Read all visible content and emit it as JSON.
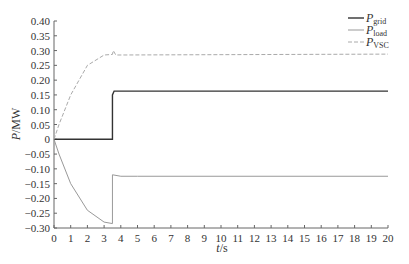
{
  "chart_data": {
    "type": "line",
    "title": "",
    "xlabel": "t/s",
    "ylabel": "P/MW",
    "xlim": [
      0,
      20
    ],
    "ylim": [
      -0.3,
      0.4
    ],
    "x_ticks": [
      "0",
      "1",
      "2",
      "3",
      "4",
      "5",
      "6",
      "7",
      "8",
      "9",
      "10",
      "11",
      "12",
      "13",
      "14",
      "15",
      "16",
      "17",
      "18",
      "19",
      "20"
    ],
    "y_ticks": [
      "0.40",
      "0.35",
      "0.30",
      "0.25",
      "0.20",
      "0.15",
      "0.10",
      "0.05",
      "0",
      "-0.05",
      "-0.10",
      "-0.15",
      "-0.20",
      "-0.25",
      "-0.30"
    ],
    "grid": false,
    "legend_position": "upper right",
    "series": [
      {
        "name": "P_grid",
        "style": "solid dark",
        "color": "#333333",
        "x": [
          0,
          3.5,
          3.5,
          3.6,
          20
        ],
        "values": [
          0,
          0,
          0.15,
          0.163,
          0.163
        ]
      },
      {
        "name": "P_load",
        "style": "solid light",
        "color": "#999999",
        "x": [
          0,
          0.3,
          1,
          2,
          3,
          3.5,
          3.5,
          4,
          5,
          20
        ],
        "values": [
          0,
          -0.05,
          -0.15,
          -0.24,
          -0.28,
          -0.285,
          -0.12,
          -0.125,
          -0.125,
          -0.125
        ]
      },
      {
        "name": "P_VSC",
        "style": "dashed",
        "color": "#aaaaaa",
        "x": [
          0,
          0.3,
          1,
          2,
          3,
          3.5,
          3.55,
          3.7,
          20
        ],
        "values": [
          0,
          0.05,
          0.15,
          0.25,
          0.285,
          0.287,
          0.3,
          0.285,
          0.288
        ]
      }
    ]
  },
  "legend": {
    "items": [
      {
        "main": "P",
        "sub": "grid"
      },
      {
        "main": "P",
        "sub": "load"
      },
      {
        "main": "P",
        "sub": "VSC"
      }
    ]
  },
  "axis": {
    "xlabel_main": "t",
    "xlabel_unit": "/s",
    "ylabel_main": "P",
    "ylabel_unit": "/MW"
  }
}
